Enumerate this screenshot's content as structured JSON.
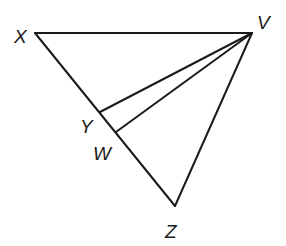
{
  "diagram": {
    "type": "triangle-with-cevians",
    "stroke_color": "#1a1a1a",
    "background": "#ffffff",
    "points": {
      "X": {
        "label": "X",
        "x": 35,
        "y": 33,
        "label_x": 14,
        "label_y": 43
      },
      "V": {
        "label": "V",
        "x": 252,
        "y": 33,
        "label_x": 257,
        "label_y": 29
      },
      "Z": {
        "label": "Z",
        "x": 175,
        "y": 206,
        "label_x": 165,
        "label_y": 238
      },
      "Y": {
        "label": "Y",
        "x": 100,
        "y": 112,
        "label_x": 80,
        "label_y": 133
      },
      "W": {
        "label": "W",
        "x": 116,
        "y": 132,
        "label_x": 93,
        "label_y": 160
      }
    },
    "segments": [
      {
        "name": "segment-xv",
        "from": "X",
        "to": "V"
      },
      {
        "name": "segment-xz",
        "from": "X",
        "to": "Z"
      },
      {
        "name": "segment-vz",
        "from": "V",
        "to": "Z"
      },
      {
        "name": "segment-vy",
        "from": "V",
        "to": "Y"
      },
      {
        "name": "segment-vw",
        "from": "V",
        "to": "W"
      }
    ]
  }
}
